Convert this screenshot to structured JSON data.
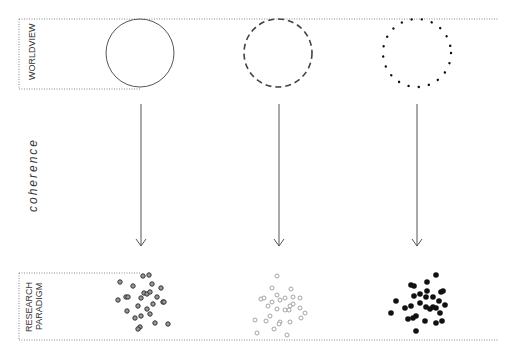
{
  "rows": {
    "top_label": "WORLDVIEW",
    "bottom_label_line1": "RESEARCH",
    "bottom_label_line2": "PARADIGM"
  },
  "middle_label": "coherence",
  "columns": [
    {
      "circle_style": "solid",
      "scatter_style": "dark-ringed"
    },
    {
      "circle_style": "dashed",
      "scatter_style": "light-hollow"
    },
    {
      "circle_style": "dotted",
      "scatter_style": "solid-black"
    }
  ],
  "colors": {
    "line": "#555555",
    "frame": "#888888",
    "text": "#333333"
  }
}
